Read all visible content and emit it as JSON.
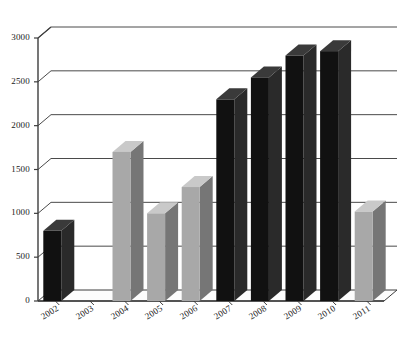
{
  "chart_data": {
    "type": "bar",
    "title": "",
    "subtitle": "",
    "xlabel": "",
    "ylabel": "",
    "categories": [
      "2002",
      "2003",
      "2004",
      "2005",
      "2006",
      "2007",
      "2008",
      "2009",
      "2010",
      "2011"
    ],
    "values": [
      800,
      0,
      1700,
      1000,
      1300,
      2300,
      2550,
      2800,
      2850,
      1020
    ],
    "bar_colors": [
      "#111111",
      "#111111",
      "#a8a8a8",
      "#a8a8a8",
      "#a8a8a8",
      "#111111",
      "#111111",
      "#111111",
      "#111111",
      "#a8a8a8"
    ],
    "ylim": [
      0,
      3000
    ],
    "ytick_values": [
      0,
      500,
      1000,
      1500,
      2000,
      2500,
      3000
    ],
    "ytick_labels": [
      "0",
      "500",
      "1000",
      "1500",
      "2000",
      "2500",
      "3000"
    ],
    "grid": true,
    "legend": false,
    "style": "3d-column",
    "palette": {
      "dark_bar": "#111111",
      "light_bar": "#a8a8a8",
      "light_bar_side": "#767676",
      "light_bar_top": "#c9c9c9",
      "dark_bar_side": "#2a2a2a",
      "dark_bar_top": "#3a3a3a",
      "axis": "#3d3d3d",
      "grid": "#4a4a4a",
      "floor": "#ffffff",
      "text": "#1a1a1a",
      "background": "#ffffff"
    }
  }
}
